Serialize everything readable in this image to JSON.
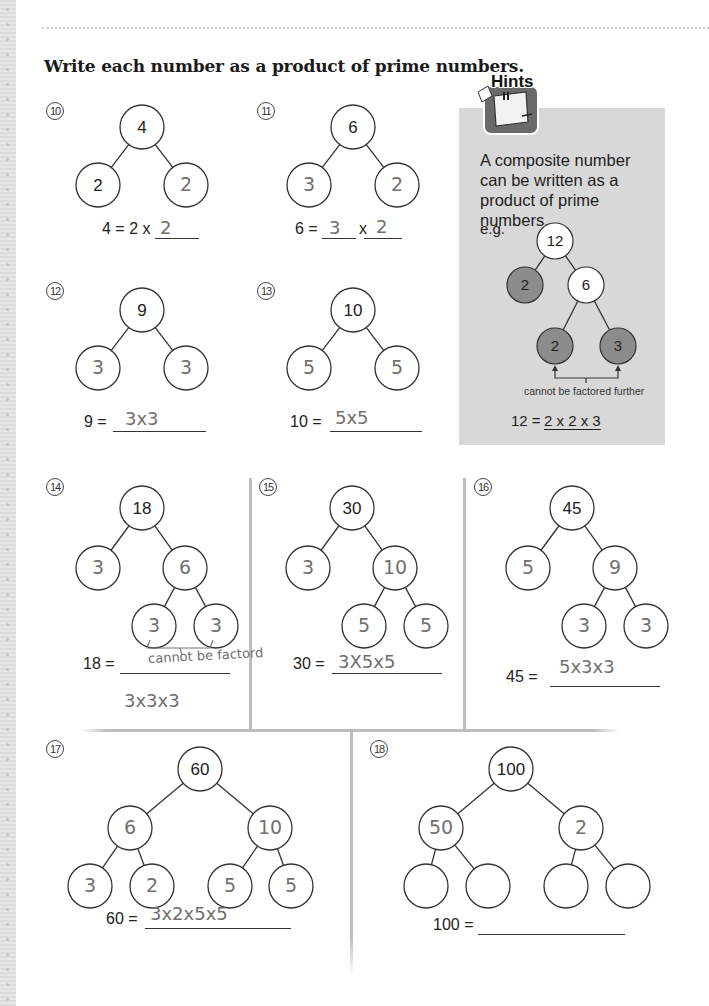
{
  "page": {
    "instruction": "Write each number as a product of prime numbers."
  },
  "hints": {
    "title": "Hints",
    "text": "A composite number can be written as a product of prime numbers.",
    "example_label": "e.g.",
    "example_tree": {
      "root": "12",
      "left": "2",
      "right": "6",
      "right_left": "2",
      "right_right": "3"
    },
    "caption": "cannot be factored further",
    "answer_label": "12 =",
    "answer": "2 x 2 x 3",
    "colors": {
      "panel": "#d8d8d8",
      "prime_fill": "#8c8c8c",
      "composite_fill": "#ffffff"
    }
  },
  "problems": [
    {
      "number": "10",
      "label": "⑩",
      "type": "simple",
      "root": "4",
      "left": "2",
      "right": "2",
      "left_handwritten": false,
      "right_handwritten": true,
      "equation_prefix": "4 = 2 x",
      "answer": "2"
    },
    {
      "number": "11",
      "label": "⑪",
      "type": "simple_two_blanks",
      "root": "6",
      "left": "3",
      "right": "2",
      "left_handwritten": true,
      "right_handwritten": true,
      "equation_prefix": "6 =",
      "equation_mid": "x",
      "answer_1": "3",
      "answer_2": "2"
    },
    {
      "number": "12",
      "label": "⑫",
      "type": "simple",
      "root": "9",
      "left": "3",
      "right": "3",
      "left_handwritten": true,
      "right_handwritten": true,
      "equation_prefix": "9 =",
      "answer": "3x3"
    },
    {
      "number": "13",
      "label": "⑬",
      "type": "simple",
      "root": "10",
      "left": "5",
      "right": "5",
      "left_handwritten": true,
      "right_handwritten": true,
      "equation_prefix": "10 =",
      "answer": "5x5"
    },
    {
      "number": "14",
      "label": "⑭",
      "type": "three_level",
      "root": "18",
      "left": "3",
      "right": "6",
      "right_left": "3",
      "right_right": "3",
      "equation_prefix": "18 =",
      "annotation": "cannot be factord",
      "answer": "3x3x3"
    },
    {
      "number": "15",
      "label": "⑮",
      "type": "three_level",
      "root": "30",
      "left": "3",
      "right": "10",
      "right_left": "5",
      "right_right": "5",
      "equation_prefix": "30 =",
      "answer": "3X5x5"
    },
    {
      "number": "16",
      "label": "⑯",
      "type": "three_level",
      "root": "45",
      "left": "5",
      "right": "9",
      "right_left": "3",
      "right_right": "3",
      "equation_prefix": "45 =",
      "answer": "5x3x3"
    },
    {
      "number": "17",
      "label": "⑰",
      "type": "full",
      "root": "60",
      "left": "6",
      "right": "10",
      "leaves": [
        "3",
        "2",
        "5",
        "5"
      ],
      "equation_prefix": "60 =",
      "answer": "3x2x5x5"
    },
    {
      "number": "18",
      "label": "⑱",
      "type": "full",
      "root": "100",
      "left": "50",
      "right": "2",
      "leaves": [
        "",
        "",
        "",
        ""
      ],
      "equation_prefix": "100 =",
      "answer": ""
    }
  ]
}
